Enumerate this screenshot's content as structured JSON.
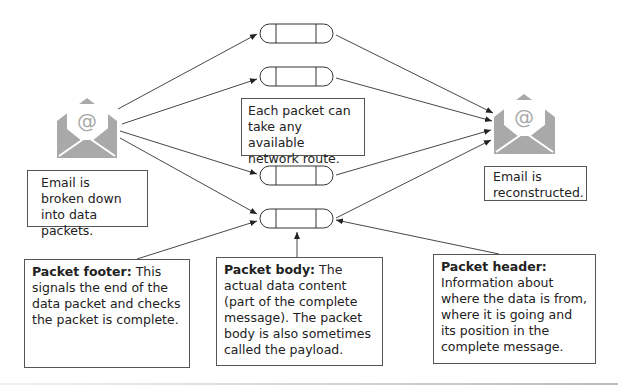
{
  "diagram": {
    "source_label": "Email is broken down into data packets.",
    "route_label": "Each packet can take any available network route.",
    "destination_label": "Email is reconstructed.",
    "packets": [
      {
        "id": "packet-1"
      },
      {
        "id": "packet-2"
      },
      {
        "id": "packet-3"
      },
      {
        "id": "packet-4"
      }
    ],
    "callouts": {
      "footer": {
        "term": "Packet footer:",
        "text": " This signals the end of the data packet and checks the packet is complete."
      },
      "body": {
        "term": "Packet body:",
        "text": " The actual data content (part of the complete message). The packet body is also sometimes called the payload."
      },
      "header": {
        "term": "Packet header:",
        "text": " Information about where the data is from, where it is going and its position in the complete message."
      }
    },
    "icons": {
      "source": "email-envelope-icon",
      "destination": "email-envelope-icon",
      "symbol": "@"
    },
    "colors": {
      "icon_gray": "#a9a9a9",
      "line": "#333333",
      "border": "#555555"
    }
  }
}
